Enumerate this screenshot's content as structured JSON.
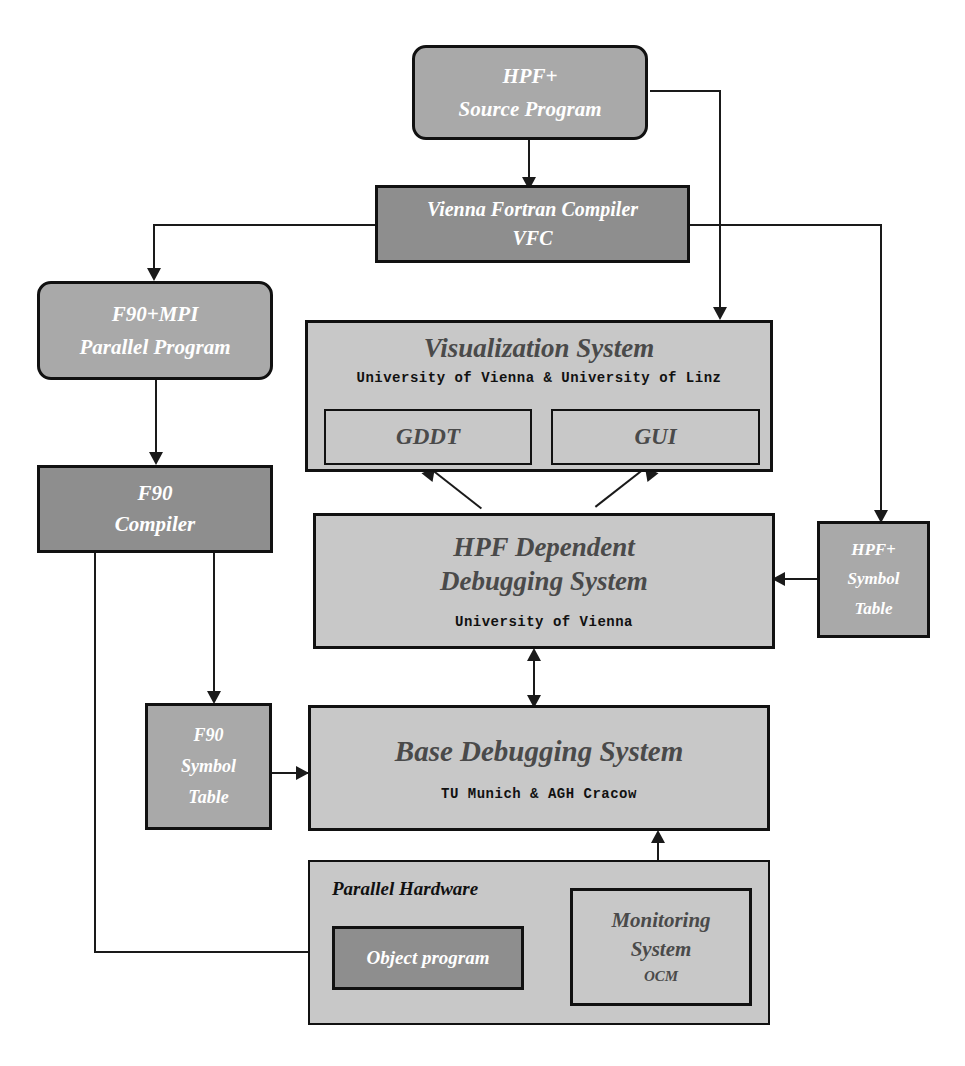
{
  "diagram": {
    "colors": {
      "fill_light": "#c8c8c8",
      "fill_mid": "#a9a9a9",
      "fill_dark": "#8e8e8e",
      "stroke": "#111111",
      "text_dark": "#4a4a4a",
      "text_light": "#ffffff"
    },
    "nodes": {
      "hpf_source": {
        "line1": "HPF+",
        "line2": "Source Program"
      },
      "vfc": {
        "line1": "Vienna Fortran Compiler",
        "line2": "VFC"
      },
      "f90mpi": {
        "line1": "F90+MPI",
        "line2": "Parallel Program"
      },
      "f90_compiler": {
        "line1": "F90",
        "line2": "Compiler"
      },
      "visualization": {
        "title": "Visualization System",
        "subtitle": "University of Vienna & University of Linz",
        "child_left": "GDDT",
        "child_right": "GUI"
      },
      "hpf_dep_dbg": {
        "line1": "HPF Dependent",
        "line2": "Debugging System",
        "subtitle": "University of Vienna"
      },
      "hpf_symbol_table": {
        "line1": "HPF+",
        "line2": "Symbol",
        "line3": "Table"
      },
      "f90_symbol_table": {
        "line1": "F90",
        "line2": "Symbol",
        "line3": "Table"
      },
      "base_dbg": {
        "title": "Base Debugging System",
        "subtitle": "TU Munich & AGH Cracow"
      },
      "parallel_hardware": {
        "label": "Parallel Hardware"
      },
      "object_program": {
        "label": "Object program"
      },
      "monitoring": {
        "line1": "Monitoring",
        "line2": "System",
        "subtitle": "OCM"
      }
    },
    "edges": [
      {
        "from": "hpf_source",
        "to": "vfc",
        "arrow": "single"
      },
      {
        "from": "hpf_source",
        "to": "visualization",
        "arrow": "single"
      },
      {
        "from": "vfc",
        "to": "f90mpi",
        "arrow": "single"
      },
      {
        "from": "vfc",
        "to": "hpf_symbol_table",
        "arrow": "single"
      },
      {
        "from": "f90mpi",
        "to": "f90_compiler",
        "arrow": "single"
      },
      {
        "from": "f90_compiler",
        "to": "f90_symbol_table",
        "arrow": "single"
      },
      {
        "from": "f90_compiler",
        "to": "object_program",
        "arrow": "single"
      },
      {
        "from": "gddt",
        "to": "hpf_dep_dbg",
        "arrow": "single"
      },
      {
        "from": "gui",
        "to": "hpf_dep_dbg",
        "arrow": "single"
      },
      {
        "from": "hpf_symbol_table",
        "to": "hpf_dep_dbg",
        "arrow": "single"
      },
      {
        "from": "f90_symbol_table",
        "to": "base_dbg",
        "arrow": "single"
      },
      {
        "from": "hpf_dep_dbg",
        "to": "base_dbg",
        "arrow": "double"
      },
      {
        "from": "base_dbg",
        "to": "monitoring",
        "arrow": "double"
      },
      {
        "from": "object_program",
        "to": "monitoring",
        "arrow": "double"
      }
    ]
  }
}
